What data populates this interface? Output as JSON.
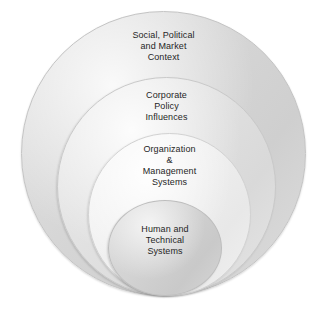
{
  "diagram": {
    "type": "nested-concentric-circles",
    "title": "",
    "background_color": "#ffffff",
    "text_color": "#262626",
    "layers": [
      {
        "id": "social-political-market-context",
        "level": 1,
        "position": "outermost",
        "label": "Social, Political\nand Market\nContext",
        "lines": [
          "Social, Political",
          "and Market",
          "Context"
        ],
        "fill_color": "#d6d6d6",
        "border_color": "#c4c4c4"
      },
      {
        "id": "corporate-policy-influences",
        "level": 2,
        "position": "second",
        "label": "Corporate\nPolicy\nInfluences",
        "lines": [
          "Corporate",
          "Policy",
          "Influences"
        ],
        "fill_color": "#e0e0e0",
        "border_color": "#c9c9c9"
      },
      {
        "id": "organization-management-systems",
        "level": 3,
        "position": "third",
        "label": "Organization\n&\nManagement\nSystems",
        "lines": [
          "Organization",
          "&",
          "Management",
          "Systems"
        ],
        "fill_color": "#efefef",
        "border_color": "#d2d2d2"
      },
      {
        "id": "human-technical-systems",
        "level": 4,
        "position": "innermost",
        "label": "Human and\nTechnical\nSystems",
        "lines": [
          "Human and",
          "Technical",
          "Systems"
        ],
        "fill_color": "#d2d2d2",
        "border_color": "#bdbdbd"
      }
    ]
  }
}
